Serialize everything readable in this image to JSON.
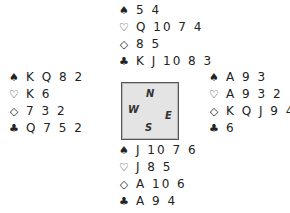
{
  "suit_symbols": {
    "spades": "♠",
    "hearts": "♡",
    "diamonds": "◇",
    "clubs": "♣"
  },
  "hands": {
    "north": {
      "spades": "5 4",
      "hearts": "Q 10 7 4",
      "diamonds": "8 5",
      "clubs": "K J 10 8 3"
    },
    "west": {
      "spades": "K Q 8 2",
      "hearts": "K 6",
      "diamonds": "7 3 2",
      "clubs": "Q 7 5 2"
    },
    "east": {
      "spades": "A 9 3",
      "hearts": "A 9 3 2",
      "diamonds": "K Q J 9 4",
      "clubs": "6"
    },
    "south": {
      "spades": "J 10 7 6",
      "hearts": "J 8 5",
      "diamonds": "A 10 6",
      "clubs": "A 9 4"
    }
  },
  "compass": {
    "north": "N",
    "west": "W",
    "east": "E",
    "south": "S"
  }
}
